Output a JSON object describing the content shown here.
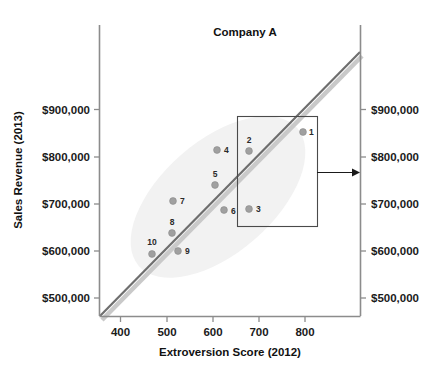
{
  "chart_data": {
    "type": "scatter",
    "title": "Company A",
    "xlabel": "Extroversion Score (2012)",
    "ylabel": "Sales Revenue (2013)",
    "xlim": [
      352,
      880
    ],
    "ylim": [
      455,
      980
    ],
    "grid": false,
    "legend": "none",
    "x_ticks": [
      400,
      500,
      600,
      700,
      800
    ],
    "x_tick_labels": [
      "400",
      "500",
      "600",
      "700",
      "800"
    ],
    "y_ticks": [
      500000,
      600000,
      700000,
      800000,
      900000
    ],
    "y_tick_labels_left": [
      "$500,000",
      "$600,000",
      "$700,000",
      "$800,000",
      "$900,000"
    ],
    "y_tick_labels_right": [
      "$500,000",
      "$600,000",
      "$700,000",
      "$800,000",
      "$900,000"
    ],
    "point_labels": [
      "1",
      "2",
      "3",
      "4",
      "5",
      "6",
      "7",
      "8",
      "9",
      "10"
    ],
    "points": [
      {
        "label": "1",
        "x": 795,
        "y": 849000
      },
      {
        "label": "2",
        "x": 679,
        "y": 809000
      },
      {
        "label": "3",
        "x": 680,
        "y": 686000
      },
      {
        "label": "4",
        "x": 609,
        "y": 810000
      },
      {
        "label": "5",
        "x": 605,
        "y": 735000
      },
      {
        "label": "6",
        "x": 625,
        "y": 684000
      },
      {
        "label": "7",
        "x": 514,
        "y": 702000
      },
      {
        "label": "8",
        "x": 513,
        "y": 634000
      },
      {
        "label": "9",
        "x": 525,
        "y": 595000
      },
      {
        "label": "10",
        "x": 464,
        "y": 589000
      }
    ],
    "trendline": {
      "x0": 352,
      "y0": 462000,
      "x1": 880,
      "y1": 982000
    },
    "annotations": [
      {
        "name": "highlight-box",
        "x0": 655,
        "y0": 655000,
        "x1": 830,
        "y1": 876000
      },
      {
        "name": "callout-arrow",
        "from_x": 830,
        "from_y": 767000,
        "to_x": 915,
        "to_y": 767000
      }
    ]
  },
  "colors": {
    "point": "#a0a0a0",
    "trendline": "#6e6e6e",
    "trendline_shadow": "#c9c9c9",
    "axis": "#8c8c8c",
    "text": "#111111",
    "cloud": "#f2f2f2",
    "box": "#4a4a4a"
  }
}
